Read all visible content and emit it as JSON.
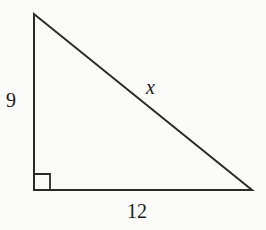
{
  "figure": {
    "type": "right-triangle",
    "vertices": {
      "top": [
        34,
        14
      ],
      "right_angle": [
        34,
        190
      ],
      "right": [
        252,
        190
      ]
    },
    "labels": {
      "vertical_leg": "9",
      "horizontal_leg": "12",
      "hypotenuse": "x"
    },
    "right_angle_marker": true,
    "stroke_color": "#2a2a2a",
    "background": "#fbfbfa"
  }
}
